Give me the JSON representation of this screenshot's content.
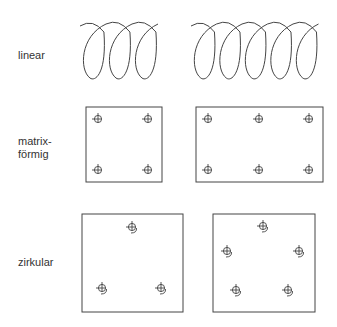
{
  "rows": [
    {
      "label": "linear",
      "label_lines": [
        "linear"
      ]
    },
    {
      "label": "matrixförmig",
      "label_lines": [
        "matrix-",
        "förmig"
      ]
    },
    {
      "label": "zirkular",
      "label_lines": [
        "zirkular"
      ]
    }
  ],
  "linear": {
    "left_coil_loops": 3,
    "right_coil_loops": 5
  },
  "matrix": {
    "left_grid": {
      "cols": 2,
      "rows": 2
    },
    "right_grid": {
      "cols": 3,
      "rows": 2
    }
  },
  "circular": {
    "left_count": 3,
    "right_count": 5
  },
  "colors": {
    "line": "#444444",
    "text": "#333333",
    "background": "#ffffff"
  }
}
